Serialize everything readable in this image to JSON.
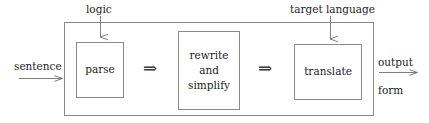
{
  "diagram": {
    "type": "pipeline-flow-diagram",
    "colors": {
      "stroke": "#8a8a8a",
      "box_stroke": "#8a8a8a",
      "text": "#1c1c1c",
      "background": "#ffffff"
    },
    "outer_container": {
      "name": "system-boundary",
      "x": 64,
      "y": 22,
      "width": 310,
      "height": 94
    },
    "stages": [
      {
        "id": "parse",
        "label": "parse",
        "lines": [
          "parse"
        ],
        "x": 76,
        "y": 42,
        "width": 48,
        "height": 56
      },
      {
        "id": "rewrite-and-simplify",
        "label": "rewrite and simplify",
        "lines": [
          "rewrite",
          "and",
          "simplify"
        ],
        "x": 178,
        "y": 31,
        "width": 62,
        "height": 79
      },
      {
        "id": "translate",
        "label": "translate",
        "lines": [
          "translate"
        ],
        "x": 294,
        "y": 44,
        "width": 68,
        "height": 56
      }
    ],
    "connectors": [
      {
        "id": "parse-to-rewrite",
        "glyph": "⇒",
        "x": 143,
        "y": 60
      },
      {
        "id": "rewrite-to-translate",
        "glyph": "⇒",
        "x": 258,
        "y": 60
      }
    ],
    "input": {
      "label": "sentence",
      "arrow": "right-arrow"
    },
    "output": {
      "label_top": "output",
      "label_bottom": "form",
      "arrow": "right-arrow"
    },
    "annotations": [
      {
        "id": "logic",
        "label": "logic",
        "arrow": "down-arrow",
        "target_stage": "parse"
      },
      {
        "id": "target-language",
        "label": "target language",
        "arrow": "down-arrow",
        "target_stage": "translate"
      }
    ]
  }
}
